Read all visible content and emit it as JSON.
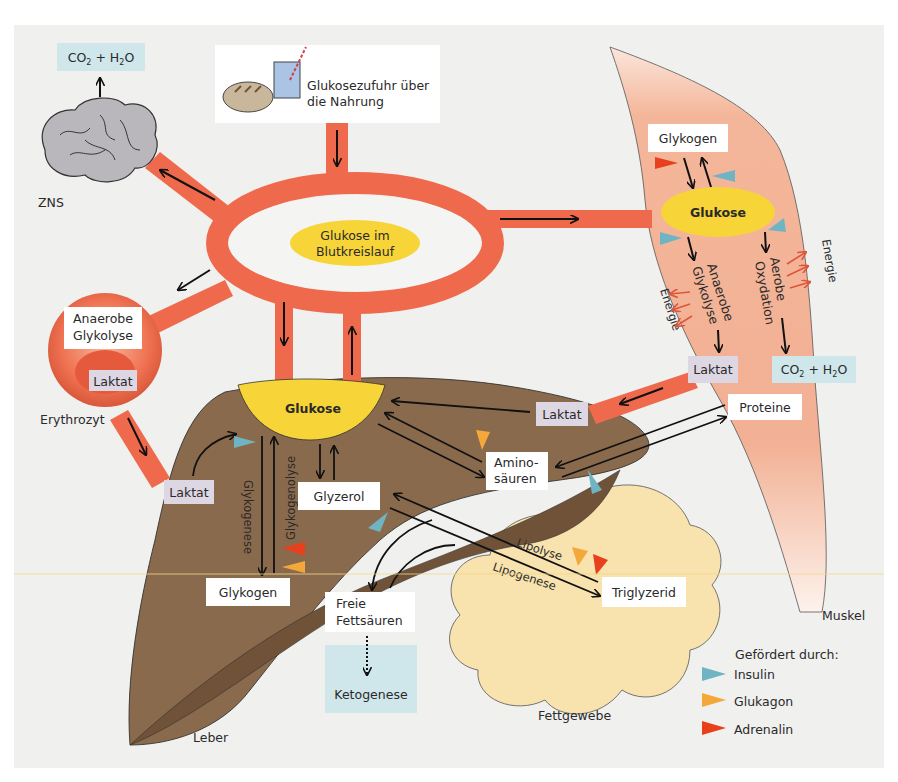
{
  "colors": {
    "background": "#f0f0ee",
    "vessel": "#ef6a4c",
    "glucose_yellow": "#f7d437",
    "liver_brown": "#8a6a4c",
    "liver_dark": "#6f5238",
    "muscle": "#f3b497",
    "fat": "#f8e2ad",
    "lactate_box": "#ddd7e3",
    "co2_box": "#cfe6ea",
    "insulin": "#6fb4c2",
    "glukagon": "#f4a83a",
    "adrenalin": "#e8401c"
  },
  "brain": {
    "label": "ZNS",
    "output_box": {
      "co2": "CO",
      "sub2": "2",
      "plus": " + H",
      "sub2b": "2",
      "o": "O"
    }
  },
  "food": {
    "line1": "Glukosezufuhr über",
    "line2": "die Nahrung"
  },
  "blood": {
    "line1": "Glukose im",
    "line2": "Blutkreislauf"
  },
  "erythrocyte": {
    "label": "Erythrozyt",
    "process_line1": "Anaerobe",
    "process_line2": "Glykolyse",
    "lactate": "Laktat"
  },
  "muscle": {
    "label": "Muskel",
    "glycogen": "Glykogen",
    "glucose": "Glukose",
    "anaerobic_line1": "Anaerobe",
    "anaerobic_line2": "Glykolyse",
    "aerobic_line1": "Aerobe",
    "aerobic_line2": "Oxydation",
    "energy_left": "Energie",
    "energy_right": "Energie",
    "lactate": "Laktat",
    "co2_box": {
      "co2": "CO",
      "sub2": "2",
      "plus": " + H",
      "sub2b": "2",
      "o": "O"
    }
  },
  "liver": {
    "label": "Leber",
    "glucose": "Glukose",
    "lactate_in": "Laktat",
    "glycogenesis": "Glykogenese",
    "glycogenolysis": "Glykogenolyse",
    "glycogen": "Glykogen",
    "glycerol": "Glyzerol",
    "amino_line1": "Amino-",
    "amino_line2": "säuren",
    "lactate_from_muscle": "Laktat",
    "free_fa_line1": "Freie",
    "free_fa_line2": "Fettsäuren",
    "ketogenesis": "Ketogenese"
  },
  "proteins": "Proteine",
  "fat_tissue": {
    "label": "Fettgewebe",
    "triglyceride": "Triglyzerid",
    "lipolysis": "Lipolyse",
    "lipogenesis": "Lipogenese"
  },
  "legend": {
    "title": "Gefördert durch:",
    "items": [
      {
        "name": "Insulin",
        "color": "#6fb4c2"
      },
      {
        "name": "Glukagon",
        "color": "#f4a83a"
      },
      {
        "name": "Adrenalin",
        "color": "#e8401c"
      }
    ]
  }
}
